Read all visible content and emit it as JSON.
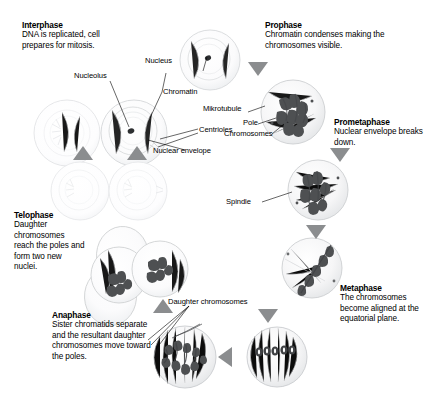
{
  "diagram": {
    "background_color": "#ffffff",
    "text_color": "#000000",
    "arrow_color": "#7f8082",
    "cell_outline_color": "#c9cbcd",
    "chromosome_color": "#555759"
  },
  "phases": [
    {
      "id": "interphase",
      "title": "Interphase",
      "description": "DNA is replicated, cell prepares for mitosis."
    },
    {
      "id": "prophase",
      "title": "Prophase",
      "description": "Chromatin condenses making the chromosomes visible."
    },
    {
      "id": "prometaphase",
      "title": "Prometaphase",
      "description": "Nuclear envelope breaks down."
    },
    {
      "id": "metaphase",
      "title": "Metaphase",
      "description": "The chromosomes become aligned at the equatorial plane."
    },
    {
      "id": "anaphase",
      "title": "Anaphase",
      "description": "Sister chromatids separate and the resultant daughter chromosomes move toward the poles."
    },
    {
      "id": "telophase",
      "title": "Telophase",
      "description": "Daughter chromosomes reach the poles and form two new nuclei."
    }
  ],
  "callouts": [
    {
      "id": "nucleolus",
      "label": "Nucleolus"
    },
    {
      "id": "nucleus",
      "label": "Nucleus"
    },
    {
      "id": "chromatin",
      "label": "Chromatin"
    },
    {
      "id": "mikrotubule",
      "label": "Mikrotubule"
    },
    {
      "id": "pole",
      "label": "Pole"
    },
    {
      "id": "chromosomes",
      "label": "Chromosomes"
    },
    {
      "id": "centrioles",
      "label": "Centrioles"
    },
    {
      "id": "nuclear-envelope",
      "label": "Nuclear envelope"
    },
    {
      "id": "spindle",
      "label": "Spindle"
    },
    {
      "id": "daughter-chromosomes",
      "label": "Daughter chromosomes"
    }
  ]
}
